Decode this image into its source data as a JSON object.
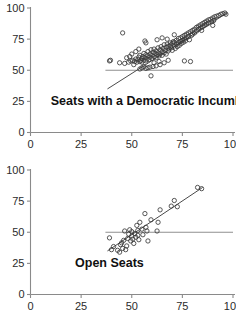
{
  "figure": {
    "kind": "scatter-panels",
    "background": "#ffffff",
    "ink_color": "#3a3a3a",
    "axis_color": "#8a8a8a",
    "reference_line_color": "#8f8f8f",
    "fit_line_color": "#4a4a4a"
  },
  "chart_data": [
    {
      "type": "scatter",
      "title": "Seats with a Democratic Incumbent",
      "xlabel": "",
      "ylabel": "",
      "xlim": [
        0,
        100
      ],
      "ylim": [
        0,
        100
      ],
      "xticks": [
        0,
        25,
        50,
        75,
        100
      ],
      "yticks": [
        0,
        25,
        50,
        75,
        100
      ],
      "xtick_labels": [
        "0",
        "25",
        "50",
        "75",
        "100"
      ],
      "ytick_labels": [
        "0",
        "25",
        "50",
        "75",
        "100"
      ],
      "grid": false,
      "legend": null,
      "annotations": [
        {
          "text": "Seats with a Democratic Incumbent",
          "x": 10,
          "y": 22,
          "bold": true
        }
      ],
      "reference_lines": [
        {
          "orientation": "horizontal",
          "y": 50,
          "x_start": 37,
          "x_end": 100,
          "color": "#8f8f8f"
        }
      ],
      "fit_line": {
        "x_start": 38,
        "y_start": 35,
        "x_end": 97,
        "y_end": 96,
        "color": "#4a4a4a"
      },
      "marker": "open-circle",
      "points": [
        [
          45.5,
          80.0
        ],
        [
          39.5,
          58.0
        ],
        [
          39.0,
          57.5
        ],
        [
          44.0,
          56.0
        ],
        [
          46.5,
          55.5
        ],
        [
          48.5,
          56.5
        ],
        [
          49.5,
          57.5
        ],
        [
          50.5,
          58.0
        ],
        [
          51.5,
          57.0
        ],
        [
          52.0,
          59.0
        ],
        [
          52.5,
          56.5
        ],
        [
          53.0,
          58.5
        ],
        [
          53.5,
          60.5
        ],
        [
          54.0,
          57.0
        ],
        [
          54.0,
          62.0
        ],
        [
          54.5,
          58.0
        ],
        [
          55.0,
          59.5
        ],
        [
          55.0,
          56.5
        ],
        [
          55.5,
          61.0
        ],
        [
          56.0,
          58.0
        ],
        [
          56.0,
          63.5
        ],
        [
          56.5,
          60.0
        ],
        [
          57.0,
          57.5
        ],
        [
          57.0,
          62.5
        ],
        [
          57.5,
          59.0
        ],
        [
          58.0,
          61.5
        ],
        [
          58.0,
          65.0
        ],
        [
          58.5,
          58.5
        ],
        [
          59.0,
          60.5
        ],
        [
          59.0,
          63.0
        ],
        [
          59.5,
          66.5
        ],
        [
          60.0,
          59.5
        ],
        [
          60.0,
          62.0
        ],
        [
          60.5,
          64.5
        ],
        [
          61.0,
          61.0
        ],
        [
          61.0,
          67.0
        ],
        [
          61.5,
          63.5
        ],
        [
          62.0,
          60.0
        ],
        [
          62.0,
          65.5
        ],
        [
          62.5,
          62.5
        ],
        [
          63.0,
          68.0
        ],
        [
          63.0,
          64.0
        ],
        [
          63.5,
          61.5
        ],
        [
          64.0,
          66.5
        ],
        [
          64.0,
          63.0
        ],
        [
          64.5,
          69.0
        ],
        [
          65.0,
          65.0
        ],
        [
          65.0,
          62.0
        ],
        [
          65.5,
          67.5
        ],
        [
          66.0,
          64.0
        ],
        [
          66.0,
          70.5
        ],
        [
          66.5,
          66.0
        ],
        [
          67.0,
          63.0
        ],
        [
          67.0,
          68.5
        ],
        [
          67.5,
          71.0
        ],
        [
          68.0,
          65.5
        ],
        [
          68.0,
          69.0
        ],
        [
          68.5,
          67.0
        ],
        [
          69.0,
          72.0
        ],
        [
          69.0,
          70.0
        ],
        [
          69.5,
          68.0
        ],
        [
          70.0,
          71.5
        ],
        [
          70.0,
          66.0
        ],
        [
          70.5,
          73.0
        ],
        [
          71.0,
          69.5
        ],
        [
          71.0,
          72.5
        ],
        [
          71.5,
          67.5
        ],
        [
          72.0,
          74.0
        ],
        [
          72.0,
          71.0
        ],
        [
          72.5,
          69.0
        ],
        [
          73.0,
          75.5
        ],
        [
          73.0,
          72.0
        ],
        [
          73.5,
          70.0
        ],
        [
          74.0,
          76.0
        ],
        [
          74.0,
          73.0
        ],
        [
          74.5,
          71.5
        ],
        [
          75.0,
          77.0
        ],
        [
          75.0,
          74.0
        ],
        [
          75.5,
          72.5
        ],
        [
          76.0,
          78.0
        ],
        [
          76.0,
          75.0
        ],
        [
          76.5,
          73.5
        ],
        [
          77.0,
          79.0
        ],
        [
          77.0,
          76.0
        ],
        [
          78.0,
          80.0
        ],
        [
          78.0,
          77.0
        ],
        [
          78.5,
          74.5
        ],
        [
          79.0,
          81.0
        ],
        [
          79.5,
          78.0
        ],
        [
          80.0,
          82.0
        ],
        [
          80.0,
          79.0
        ],
        [
          81.0,
          83.0
        ],
        [
          81.0,
          80.0
        ],
        [
          82.0,
          84.5
        ],
        [
          82.0,
          81.5
        ],
        [
          83.0,
          85.5
        ],
        [
          83.0,
          83.0
        ],
        [
          84.0,
          86.5
        ],
        [
          84.0,
          84.0
        ],
        [
          85.0,
          87.5
        ],
        [
          85.0,
          85.0
        ],
        [
          86.0,
          88.5
        ],
        [
          86.0,
          86.0
        ],
        [
          87.0,
          89.5
        ],
        [
          87.0,
          87.0
        ],
        [
          88.0,
          90.5
        ],
        [
          88.0,
          88.0
        ],
        [
          89.0,
          91.0
        ],
        [
          89.5,
          89.0
        ],
        [
          90.0,
          92.0
        ],
        [
          90.5,
          90.0
        ],
        [
          91.0,
          93.0
        ],
        [
          92.0,
          93.5
        ],
        [
          93.0,
          94.0
        ],
        [
          94.0,
          95.0
        ],
        [
          95.0,
          95.5
        ],
        [
          96.0,
          96.0
        ],
        [
          96.5,
          95.0
        ],
        [
          90.0,
          86.0
        ],
        [
          84.5,
          82.0
        ],
        [
          79.0,
          57.0
        ],
        [
          76.0,
          57.5
        ],
        [
          66.0,
          56.0
        ],
        [
          64.0,
          54.5
        ],
        [
          62.0,
          53.5
        ],
        [
          60.5,
          53.0
        ],
        [
          59.0,
          52.5
        ],
        [
          58.0,
          52.0
        ],
        [
          57.0,
          51.5
        ],
        [
          56.0,
          53.0
        ],
        [
          55.0,
          52.0
        ],
        [
          54.0,
          51.0
        ],
        [
          59.5,
          45.5
        ],
        [
          51.0,
          54.5
        ],
        [
          49.0,
          61.0
        ],
        [
          47.5,
          60.0
        ],
        [
          56.5,
          73.5
        ],
        [
          57.0,
          72.0
        ],
        [
          62.5,
          74.5
        ],
        [
          65.0,
          76.0
        ],
        [
          71.0,
          78.5
        ],
        [
          67.5,
          75.0
        ],
        [
          53.5,
          67.0
        ],
        [
          52.0,
          65.0
        ],
        [
          50.0,
          63.0
        ],
        [
          61.0,
          56.0
        ],
        [
          63.5,
          57.0
        ],
        [
          68.0,
          58.0
        ]
      ]
    },
    {
      "type": "scatter",
      "title": "Open Seats",
      "xlabel": "",
      "ylabel": "",
      "xlim": [
        0,
        100
      ],
      "ylim": [
        0,
        100
      ],
      "xticks": [
        0,
        25,
        50,
        75,
        100
      ],
      "yticks": [
        0,
        25,
        50,
        75,
        100
      ],
      "xtick_labels": [
        "0",
        "25",
        "50",
        "75",
        "100"
      ],
      "ytick_labels": [
        "0",
        "25",
        "50",
        "75",
        "100"
      ],
      "grid": false,
      "legend": null,
      "annotations": [
        {
          "text": "Open Seats",
          "x": 22,
          "y": 22,
          "bold": true
        }
      ],
      "reference_lines": [
        {
          "orientation": "horizontal",
          "y": 50,
          "x_start": 37,
          "x_end": 100,
          "color": "#8f8f8f"
        }
      ],
      "fit_line": {
        "x_start": 38,
        "y_start": 35,
        "x_end": 85,
        "y_end": 86,
        "color": "#4a4a4a"
      },
      "marker": "open-circle",
      "points": [
        [
          39.0,
          45.5
        ],
        [
          40.0,
          36.0
        ],
        [
          41.0,
          38.5
        ],
        [
          43.0,
          35.5
        ],
        [
          44.0,
          34.0
        ],
        [
          44.5,
          40.0
        ],
        [
          45.5,
          37.0
        ],
        [
          46.0,
          43.5
        ],
        [
          46.5,
          51.0
        ],
        [
          47.5,
          39.0
        ],
        [
          48.0,
          45.0
        ],
        [
          48.5,
          48.5
        ],
        [
          49.0,
          52.0
        ],
        [
          49.5,
          43.0
        ],
        [
          50.0,
          47.0
        ],
        [
          50.0,
          50.5
        ],
        [
          50.5,
          44.5
        ],
        [
          51.0,
          41.0
        ],
        [
          51.5,
          49.0
        ],
        [
          52.0,
          46.0
        ],
        [
          52.5,
          55.5
        ],
        [
          53.0,
          51.5
        ],
        [
          53.5,
          44.0
        ],
        [
          54.0,
          58.0
        ],
        [
          55.0,
          52.5
        ],
        [
          55.5,
          48.0
        ],
        [
          56.5,
          65.0
        ],
        [
          57.0,
          54.0
        ],
        [
          57.5,
          51.0
        ],
        [
          58.0,
          43.0
        ],
        [
          59.5,
          60.0
        ],
        [
          62.5,
          51.0
        ],
        [
          63.0,
          58.0
        ],
        [
          64.0,
          68.0
        ],
        [
          69.5,
          71.0
        ],
        [
          71.0,
          75.5
        ],
        [
          72.5,
          70.5
        ],
        [
          82.5,
          86.0
        ],
        [
          84.5,
          85.0
        ],
        [
          45.0,
          41.5
        ],
        [
          47.0,
          36.0
        ],
        [
          53.0,
          47.5
        ]
      ]
    }
  ]
}
